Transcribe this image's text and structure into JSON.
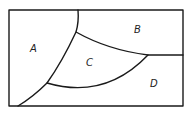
{
  "diagram": {
    "regions": [
      {
        "id": "A",
        "label": "A"
      },
      {
        "id": "B",
        "label": "B"
      },
      {
        "id": "C",
        "label": "C"
      },
      {
        "id": "D",
        "label": "D"
      }
    ],
    "colors": {
      "stroke": "#1a1a1a",
      "background": "#ffffff",
      "text": "#222222"
    }
  }
}
